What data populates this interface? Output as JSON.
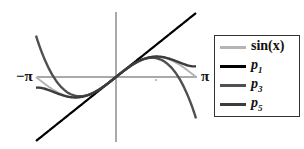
{
  "chart_data": {
    "type": "line",
    "title": "",
    "xlabel": "x",
    "ylabel": "",
    "xlim": [
      -3.14159,
      3.14159
    ],
    "ylim": [
      -3.2,
      3.2
    ],
    "grid": false,
    "legend_position": "right",
    "tick_labels": {
      "x_left": "−π",
      "x_right": "π",
      "axis_x_label": "x"
    },
    "series": [
      {
        "name": "sin(x)",
        "color": "#b4b4b4",
        "formula": "sin(x)",
        "x": [
          -3.14,
          -2.36,
          -1.57,
          -0.79,
          0,
          0.79,
          1.57,
          2.36,
          3.14
        ],
        "values": [
          0,
          -0.71,
          -1.0,
          -0.71,
          0,
          0.71,
          1.0,
          0.71,
          0
        ]
      },
      {
        "name": "p1",
        "color": "#000000",
        "formula": "x",
        "x": [
          -3.14,
          -2.36,
          -1.57,
          -0.79,
          0,
          0.79,
          1.57,
          2.36,
          3.14
        ],
        "values": [
          -3.14,
          -2.36,
          -1.57,
          -0.79,
          0,
          0.79,
          1.57,
          2.36,
          3.14
        ]
      },
      {
        "name": "p3",
        "color": "#505050",
        "formula": "x - x^3/6",
        "x": [
          -3.14,
          -2.36,
          -1.57,
          -0.79,
          0,
          0.79,
          1.57,
          2.36,
          3.14
        ],
        "values": [
          2.03,
          -0.17,
          -0.92,
          -0.71,
          0,
          0.71,
          0.92,
          0.17,
          -2.03
        ]
      },
      {
        "name": "p5",
        "color": "#3c3c3c",
        "formula": "x - x^3/6 + x^5/120",
        "x": [
          -3.14,
          -2.36,
          -1.57,
          -0.79,
          0,
          0.79,
          1.57,
          2.36,
          3.14
        ],
        "values": [
          -0.52,
          -0.78,
          -1.0,
          -0.71,
          0,
          0.71,
          1.0,
          0.78,
          0.52
        ]
      }
    ]
  },
  "labels": {
    "neg_pi": "−π",
    "pos_pi": "π",
    "x_axis_small": "x"
  },
  "legend": {
    "items": [
      {
        "main": "sin(x)",
        "sub": "",
        "color": "#b4b4b4"
      },
      {
        "main": "p",
        "sub": "1",
        "color": "#000000"
      },
      {
        "main": "p",
        "sub": "3",
        "color": "#505050"
      },
      {
        "main": "p",
        "sub": "5",
        "color": "#3c3c3c"
      }
    ]
  }
}
